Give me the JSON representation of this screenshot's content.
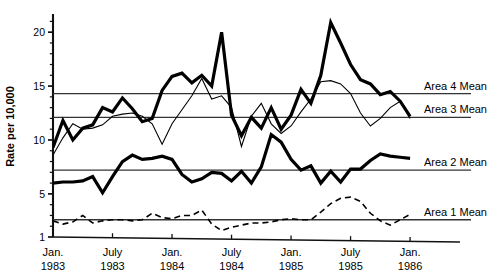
{
  "chart_data": {
    "type": "line",
    "title": "",
    "xlabel": "",
    "ylabel": "Rate per 10,000",
    "ylim": [
      1,
      21.5
    ],
    "xlim": [
      0,
      37
    ],
    "grid": false,
    "legend_position": "right-inline",
    "yticks": [
      1,
      5,
      10,
      15,
      20
    ],
    "ytick_labels": [
      "1",
      "5",
      "10",
      "15",
      "20"
    ],
    "yminor_step": 1,
    "xticks": [
      0,
      6,
      12,
      18,
      24,
      30,
      36
    ],
    "xtick_labels": [
      {
        "month": "Jan.",
        "year": "1983"
      },
      {
        "month": "July",
        "year": "1983"
      },
      {
        "month": "Jan.",
        "year": "1984"
      },
      {
        "month": "July",
        "year": "1984"
      },
      {
        "month": "Jan.",
        "year": "1985"
      },
      {
        "month": "July",
        "year": "1985"
      },
      {
        "month": "Jan.",
        "year": "1986"
      }
    ],
    "x": [
      0,
      1,
      2,
      3,
      4,
      5,
      6,
      7,
      8,
      9,
      10,
      11,
      12,
      13,
      14,
      15,
      16,
      17,
      18,
      19,
      20,
      21,
      22,
      23,
      24,
      25,
      26,
      27,
      28,
      29,
      30,
      31,
      32,
      33,
      34,
      35,
      36
    ],
    "series": [
      {
        "name": "Area 4",
        "label": "Area 4 Mean",
        "style": "thick-solid",
        "color": "#000000",
        "linewidth": 3.2,
        "mean": 14.3,
        "values": [
          9.3,
          11.8,
          10.0,
          11.1,
          11.4,
          13.0,
          12.6,
          13.9,
          12.9,
          11.7,
          12.0,
          14.6,
          15.9,
          16.2,
          15.3,
          16.0,
          15.0,
          20.0,
          12.3,
          10.4,
          12.1,
          11.1,
          13.0,
          11.0,
          12.3,
          14.7,
          13.4,
          16.0,
          20.9,
          19.0,
          17.0,
          15.6,
          15.2,
          14.2,
          14.5,
          13.6,
          12.2
        ],
        "values_right": [
          12.2,
          11.7,
          12.6,
          10.2,
          12.4,
          11.3,
          12.0,
          10.8,
          9.9,
          10.6,
          12.2,
          13.0,
          12.4,
          11.4,
          14.8,
          13.2,
          13.2,
          15.1,
          14.2,
          14.8,
          19.4,
          21.3,
          16.9,
          14.0,
          12.3,
          13.8,
          14.2
        ]
      },
      {
        "name": "Area 3",
        "label": "Area 3 Mean",
        "style": "thin-solid",
        "color": "#000000",
        "linewidth": 1.1,
        "mean": 12.1,
        "values": [
          8.6,
          10.2,
          11.5,
          11.0,
          11.1,
          11.4,
          12.2,
          12.4,
          12.5,
          12.2,
          11.5,
          9.6,
          11.5,
          12.8,
          14.1,
          15.7,
          13.8,
          14.1,
          13.0,
          9.4,
          12.2,
          13.4,
          11.5,
          10.6,
          11.3,
          12.6,
          13.8,
          15.4,
          15.5,
          15.2,
          14.3,
          12.5,
          11.3,
          12.0,
          13.0,
          13.6,
          12.0
        ]
      },
      {
        "name": "Area 2",
        "label": "Area 2 Mean",
        "style": "thick-solid",
        "color": "#000000",
        "linewidth": 3.2,
        "mean": 7.2,
        "values": [
          6.0,
          6.1,
          6.1,
          6.2,
          6.6,
          5.1,
          6.6,
          8.0,
          8.6,
          8.2,
          8.3,
          8.5,
          8.2,
          6.8,
          6.1,
          6.4,
          7.0,
          6.9,
          6.2,
          7.1,
          6.0,
          7.5,
          10.5,
          9.8,
          8.2,
          7.2,
          7.6,
          6.0,
          7.1,
          6.1,
          7.3,
          7.3,
          8.1,
          8.7,
          8.5,
          8.4,
          8.3
        ]
      },
      {
        "name": "Area 1",
        "label": "Area 1 Mean",
        "style": "dashed",
        "color": "#000000",
        "linewidth": 1.6,
        "mean": 2.6,
        "values": [
          2.5,
          2.2,
          2.4,
          3.0,
          2.3,
          2.5,
          2.6,
          2.6,
          2.5,
          2.6,
          3.2,
          2.8,
          2.7,
          3.0,
          3.0,
          3.5,
          2.2,
          1.6,
          1.9,
          2.1,
          2.3,
          2.3,
          2.4,
          2.6,
          2.7,
          2.6,
          2.6,
          3.3,
          4.1,
          4.6,
          4.7,
          4.3,
          3.2,
          2.5,
          2.1,
          2.6,
          3.1
        ]
      }
    ]
  },
  "axis": {
    "y_title": "Rate per 10,000"
  }
}
